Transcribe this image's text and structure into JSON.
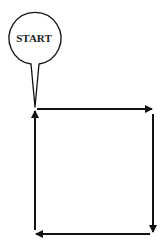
{
  "diagram": {
    "start_label": "START",
    "colors": {
      "stroke": "#111111",
      "background": "#ffffff"
    },
    "flow": [
      {
        "from": "start",
        "direction": "right",
        "segment": "top"
      },
      {
        "direction": "down",
        "segment": "right"
      },
      {
        "direction": "left",
        "segment": "bottom"
      },
      {
        "direction": "up",
        "segment": "left",
        "to": "start"
      }
    ]
  }
}
